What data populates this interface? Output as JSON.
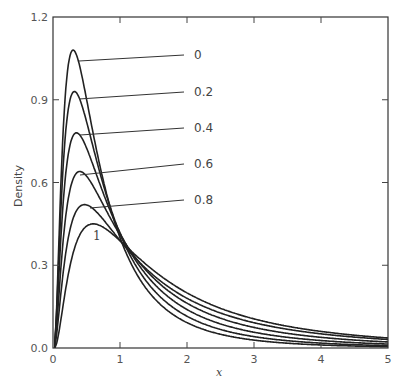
{
  "chart_data": {
    "type": "line",
    "title": "",
    "xlabel": "x",
    "ylabel": "Density",
    "xlim": [
      0,
      5
    ],
    "ylim": [
      0,
      1.2
    ],
    "x_ticks": [
      "0",
      "1",
      "2",
      "3",
      "4",
      "5"
    ],
    "y_ticks": [
      "0.0",
      "0.3",
      "0.6",
      "0.9",
      "1.2"
    ],
    "grid": false,
    "legend_position": "inline labels with leader lines",
    "series": [
      {
        "name": "0",
        "peak_x": 0.3,
        "peak_y": 1.08,
        "x": [
          0,
          0.3,
          1,
          2,
          3,
          4,
          5
        ],
        "values": [
          0,
          1.08,
          0.4,
          0.17,
          0.065,
          0.018,
          0.006
        ]
      },
      {
        "name": "0.2",
        "peak_x": 0.32,
        "peak_y": 0.93,
        "x": [
          0,
          0.32,
          1,
          2,
          3,
          4,
          5
        ],
        "values": [
          0,
          0.93,
          0.4,
          0.19,
          0.075,
          0.025,
          0.012
        ]
      },
      {
        "name": "0.4",
        "peak_x": 0.35,
        "peak_y": 0.78,
        "x": [
          0,
          0.35,
          1,
          2,
          3,
          4,
          5
        ],
        "values": [
          0,
          0.78,
          0.4,
          0.21,
          0.085,
          0.035,
          0.02
        ]
      },
      {
        "name": "0.6",
        "peak_x": 0.4,
        "peak_y": 0.64,
        "x": [
          0,
          0.4,
          1,
          2,
          3,
          4,
          5
        ],
        "values": [
          0,
          0.64,
          0.4,
          0.23,
          0.095,
          0.045,
          0.03
        ]
      },
      {
        "name": "0.8",
        "peak_x": 0.47,
        "peak_y": 0.52,
        "x": [
          0,
          0.47,
          1,
          2,
          3,
          4,
          5
        ],
        "values": [
          0,
          0.52,
          0.4,
          0.245,
          0.105,
          0.055,
          0.04
        ]
      },
      {
        "name": "1",
        "peak_x": 0.6,
        "peak_y": 0.45,
        "x": [
          0,
          0.6,
          1,
          2,
          3,
          4,
          5
        ],
        "values": [
          0,
          0.45,
          0.39,
          0.26,
          0.115,
          0.065,
          0.05
        ]
      }
    ],
    "annotations": [
      "All curves cross near x = 1, density ≈ 0.40"
    ]
  },
  "labels": {
    "curves": [
      "0",
      "0.2",
      "0.4",
      "0.6",
      "0.8",
      "1"
    ]
  }
}
